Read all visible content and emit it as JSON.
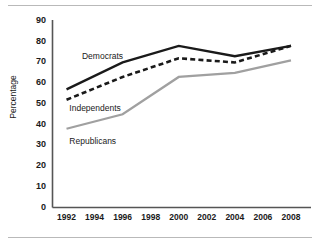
{
  "chart_data": {
    "type": "line",
    "title": "",
    "subtitle": "",
    "xlabel": "",
    "ylabel": "Percentage",
    "x": [
      1992,
      1994,
      1996,
      1998,
      2000,
      2002,
      2004,
      2006,
      2008
    ],
    "xtick_labels": [
      "1992",
      "1994",
      "1996",
      "1998",
      "2000",
      "2002",
      "2004",
      "2006",
      "2008"
    ],
    "xlim": [
      1991,
      2009
    ],
    "ylim": [
      0,
      90
    ],
    "ytick_labels": [
      "0",
      "10",
      "20",
      "30",
      "40",
      "50",
      "60",
      "70",
      "80",
      "90"
    ],
    "ytick_values": [
      0,
      10,
      20,
      30,
      40,
      50,
      60,
      70,
      80,
      90
    ],
    "grid": false,
    "legend_position": "inline-annotations",
    "series": [
      {
        "name": "Democrats",
        "style": "solid",
        "color": "#1a1a1a",
        "x": [
          1992,
          1996,
          2000,
          2004,
          2008
        ],
        "values": [
          57,
          70,
          78,
          73,
          78
        ]
      },
      {
        "name": "Independents",
        "style": "dashed",
        "color": "#1a1a1a",
        "x": [
          1992,
          1996,
          2000,
          2004,
          2008
        ],
        "values": [
          52,
          63,
          72,
          70,
          78
        ]
      },
      {
        "name": "Republicans",
        "style": "solid",
        "color": "#a0a0a0",
        "x": [
          1992,
          1996,
          2000,
          2004,
          2008
        ],
        "values": [
          38,
          45,
          63,
          65,
          71
        ]
      }
    ],
    "annotations": [
      {
        "text": "Democrats",
        "x": 1993.1,
        "y": 72.5
      },
      {
        "text": "Independents",
        "x": 1992.2,
        "y": 47.5
      },
      {
        "text": "Republicans",
        "x": 1992.2,
        "y": 31.5
      }
    ]
  },
  "axis": {
    "y_title": "Percentage"
  },
  "colors": {
    "democrats": "#1a1a1a",
    "independents": "#1a1a1a",
    "republicans": "#a0a0a0",
    "axis": "#555555",
    "rule": "#b9b9b9"
  }
}
